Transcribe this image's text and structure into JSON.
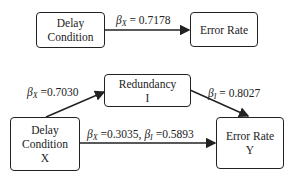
{
  "model_top": {
    "x_node": {
      "line1": "Delay",
      "line2": "Condition"
    },
    "y_node": {
      "line1": "Error Rate"
    },
    "path_xy": {
      "symbol": "β",
      "sub": "X",
      "value": " = 0.7178"
    }
  },
  "model_bottom": {
    "x_node": {
      "line1": "Delay",
      "line2": "Condition",
      "line3": "X"
    },
    "i_node": {
      "line1": "Redundancy",
      "line2": "I"
    },
    "y_node": {
      "line1": "Error Rate",
      "line2": "Y"
    },
    "path_xi": {
      "symbol": "β",
      "sub": "X",
      "value": " =0.7030"
    },
    "path_iy": {
      "symbol": "β",
      "sub": "I",
      "value": " = 0.8027"
    },
    "path_xy": {
      "symbol": "β",
      "sub": "X",
      "value": " =0.3035, ",
      "symbol2": "β",
      "sub2": "I",
      "value2": " =0.5893"
    }
  }
}
